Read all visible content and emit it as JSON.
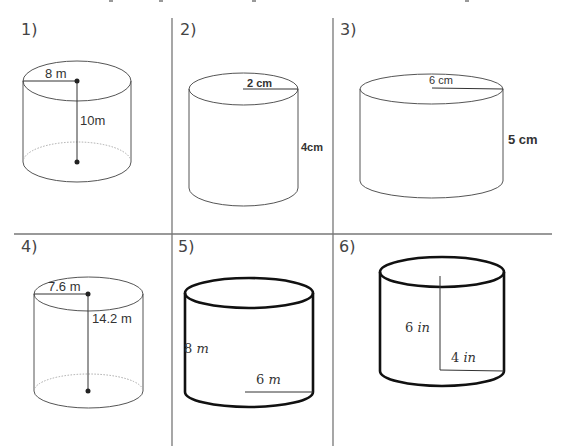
{
  "worksheet": {
    "topic": "Volume of cylinders",
    "grid": {
      "rows": 2,
      "cols": 3,
      "line_color": "#777777"
    },
    "problems": [
      {
        "number": "1)",
        "radius_label": "8 m",
        "height_label": "10m",
        "style": "thin-with-dashed-base"
      },
      {
        "number": "2)",
        "radius_label": "2 cm",
        "height_label": "4cm",
        "style": "thin"
      },
      {
        "number": "3)",
        "radius_label": "6 cm",
        "height_label": "5 cm",
        "style": "thin"
      },
      {
        "number": "4)",
        "radius_label": "7.6 m",
        "height_label": "14.2 m",
        "style": "thin-with-dashed-base"
      },
      {
        "number": "5)",
        "height_value": "8",
        "height_unit": "m",
        "radius_value": "6",
        "radius_unit": "m",
        "style": "thick"
      },
      {
        "number": "6)",
        "height_value": "6",
        "height_unit": "in",
        "radius_value": "4",
        "radius_unit": "in",
        "style": "thick"
      }
    ]
  }
}
